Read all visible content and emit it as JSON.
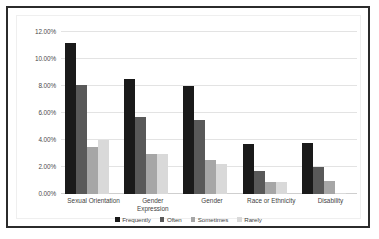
{
  "chart_data": {
    "type": "bar",
    "title": "",
    "xlabel": "",
    "ylabel": "",
    "ylim": [
      0,
      12
    ],
    "ytick_labels": [
      "0.00%",
      "2.00%",
      "4.00%",
      "6.00%",
      "8.00%",
      "10.00%",
      "12.00%"
    ],
    "ytick_values": [
      0,
      2,
      4,
      6,
      8,
      10,
      12
    ],
    "grid": true,
    "legend_position": "bottom",
    "categories": [
      "Sexual Orientation",
      "Gender Expression",
      "Gender",
      "Race or Ethnicity",
      "Disability"
    ],
    "series": [
      {
        "name": "Frequently",
        "color": "#1a1a1a",
        "values": [
          11.2,
          8.5,
          8.0,
          3.7,
          3.8
        ]
      },
      {
        "name": "Often",
        "color": "#595959",
        "values": [
          8.1,
          5.7,
          5.5,
          1.7,
          2.0
        ]
      },
      {
        "name": "Sometimes",
        "color": "#a6a6a6",
        "values": [
          3.5,
          3.0,
          2.5,
          0.9,
          1.0
        ]
      },
      {
        "name": "Rarely",
        "color": "#d9d9d9",
        "values": [
          4.0,
          2.95,
          2.2,
          0.9,
          0.1
        ]
      }
    ]
  },
  "colors": {
    "frame_border": "#2b2b2b",
    "plot_background": "#ffffff",
    "gridline": "#e3e3e3",
    "axis_text": "#4a4a4a"
  }
}
